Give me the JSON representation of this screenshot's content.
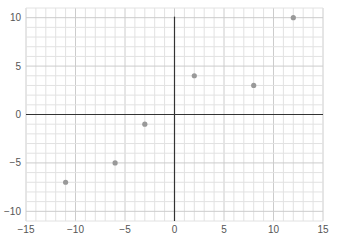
{
  "chart_data": {
    "type": "scatter",
    "title": "",
    "xlabel": "",
    "ylabel": "",
    "xlim": [
      -15,
      15
    ],
    "ylim": [
      -11,
      11
    ],
    "grid": true,
    "x_ticks": [
      -15,
      -10,
      -5,
      0,
      5,
      10,
      15
    ],
    "y_ticks": [
      -10,
      -5,
      0,
      5,
      10
    ],
    "points": [
      {
        "x": -11,
        "y": -7
      },
      {
        "x": -6,
        "y": -5
      },
      {
        "x": -3,
        "y": -1
      },
      {
        "x": 2,
        "y": 4
      },
      {
        "x": 8,
        "y": 3
      },
      {
        "x": 12,
        "y": 10
      }
    ],
    "colors": {
      "point": "#999999",
      "axis": "#333333",
      "grid_minor": "#e2e2e2",
      "grid_major": "#cccccc",
      "tick_text": "#555555"
    }
  }
}
